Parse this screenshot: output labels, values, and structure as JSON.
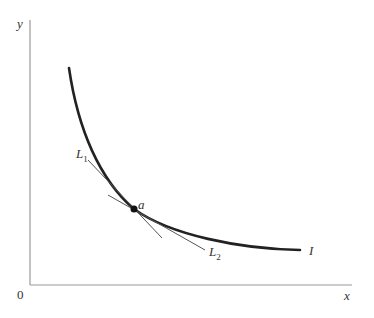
{
  "figure": {
    "type": "indifference-curve-diagram",
    "axes": {
      "y_label": "y",
      "x_label": "x",
      "origin_label": "0"
    },
    "curve": {
      "label": "I",
      "description": "convex downward-sloping curve"
    },
    "point": {
      "label": "a"
    },
    "lines": [
      {
        "label_main": "L",
        "label_sub": "1",
        "description": "steeper line through a"
      },
      {
        "label_main": "L",
        "label_sub": "2",
        "description": "flatter line through a"
      }
    ]
  },
  "colors": {
    "axis": "#9a9a9a",
    "curve": "#222222",
    "lines": "#555555",
    "text": "#333333"
  }
}
